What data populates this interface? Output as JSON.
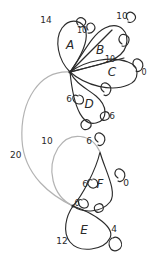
{
  "diagram": {
    "stroke_color": "#2b2b2b",
    "secondary_stroke_color": "#b3b3b3",
    "background_color": "#ffffff",
    "nodes": [
      {
        "id": "A",
        "label": "A",
        "x": 70,
        "y": 45
      },
      {
        "id": "B",
        "label": "B",
        "x": 100,
        "y": 50
      },
      {
        "id": "C",
        "label": "C",
        "x": 112,
        "y": 72
      },
      {
        "id": "D",
        "label": "D",
        "x": 89,
        "y": 104
      },
      {
        "id": "E",
        "label": "E",
        "x": 84,
        "y": 230
      },
      {
        "id": "F",
        "label": "F",
        "x": 100,
        "y": 184
      }
    ],
    "weights": [
      {
        "id": "w-14",
        "value": "14",
        "x": 46,
        "y": 20
      },
      {
        "id": "w-10-top-right",
        "value": "10",
        "x": 122,
        "y": 16
      },
      {
        "id": "w-10-ab",
        "value": "10",
        "x": 82,
        "y": 31
      },
      {
        "id": "w-10-bc",
        "value": "10",
        "x": 110,
        "y": 60
      },
      {
        "id": "w-0-c",
        "value": "0",
        "x": 144,
        "y": 73
      },
      {
        "id": "w-6-d-left",
        "value": "6",
        "x": 69,
        "y": 99
      },
      {
        "id": "w-6-d-right",
        "value": "6",
        "x": 112,
        "y": 116
      },
      {
        "id": "w-20",
        "value": "20",
        "x": 10,
        "y": 155
      },
      {
        "id": "w-10-lower",
        "value": "10",
        "x": 47,
        "y": 141
      },
      {
        "id": "w-6-top-f",
        "value": "6",
        "x": 89,
        "y": 141
      },
      {
        "id": "w-6-f-left",
        "value": "6",
        "x": 85,
        "y": 184
      },
      {
        "id": "w-0-f-right",
        "value": "0",
        "x": 126,
        "y": 183
      },
      {
        "id": "w-6-e-top",
        "value": "6",
        "x": 77,
        "y": 204
      },
      {
        "id": "w-4-e-right",
        "value": "4",
        "x": 114,
        "y": 229
      },
      {
        "id": "w-12",
        "value": "12",
        "x": 62,
        "y": 241
      }
    ],
    "vertices": [
      {
        "id": "hub-upper",
        "x": 70,
        "y": 72
      },
      {
        "id": "hub-lower",
        "x": 73,
        "y": 206
      }
    ]
  }
}
